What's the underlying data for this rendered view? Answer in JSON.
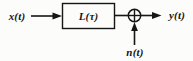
{
  "diagram": {
    "input_label": "x(t)",
    "block_label": "L(τ)",
    "output_label": "y(t)",
    "noise_label": "n(t)",
    "summing_junction_symbol": "plus-icon",
    "colors": {
      "ink": "#161616",
      "background": "#fcfcfb"
    }
  }
}
